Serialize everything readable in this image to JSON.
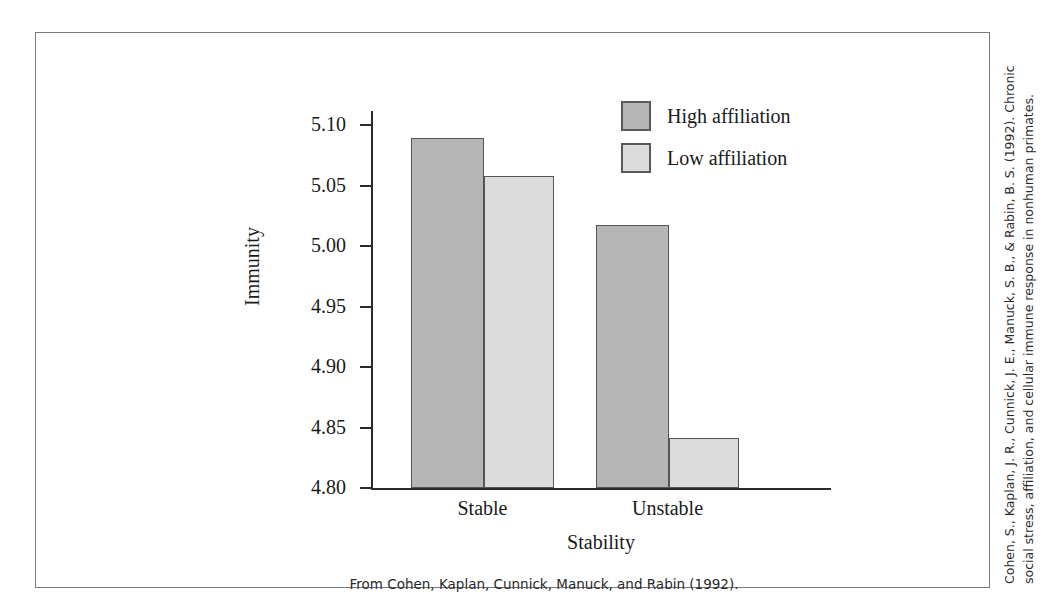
{
  "chart_data": {
    "type": "bar",
    "title": "",
    "xlabel": "Stability",
    "ylabel": "Immunity",
    "categories": [
      "Stable",
      "Unstable"
    ],
    "series": [
      {
        "name": "High affiliation",
        "color": "#b6b6b6",
        "values": [
          5.089,
          5.017
        ]
      },
      {
        "name": "Low affiliation",
        "color": "#dcdcdc",
        "values": [
          5.058,
          4.841
        ]
      }
    ],
    "ylim": [
      4.8,
      5.1
    ],
    "yticks": [
      "5.10",
      "5.05",
      "5.00",
      "4.95",
      "4.90",
      "4.85",
      "4.80"
    ],
    "ytick_values": [
      5.1,
      5.05,
      5.0,
      4.95,
      4.9,
      4.85,
      4.8
    ],
    "grid": false,
    "legend_position": "top-right"
  },
  "legend": {
    "items": [
      {
        "label": "High affiliation",
        "swatch": "high"
      },
      {
        "label": "Low affiliation",
        "swatch": "low"
      }
    ]
  },
  "source_note": "From Cohen, Kaplan, Cunnick, Manuck, and Rabin (1992).",
  "side_citation": "Cohen, S., Kaplan, J. R., Cunnick, J. E., Manuck, S. B., & Rabin, B. S. (1992). Chronic social stress, affiliation, and cellular immune response in nonhuman primates."
}
